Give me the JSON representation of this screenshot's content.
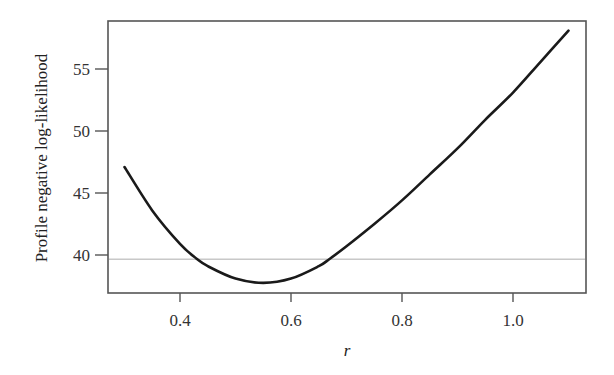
{
  "chart_data": {
    "type": "line",
    "title": "",
    "xlabel": "r",
    "ylabel": "Profile negative log-likelihood",
    "xlim": [
      0.28,
      1.13
    ],
    "ylim": [
      36.2,
      58.9
    ],
    "xticks": [
      0.4,
      0.6,
      0.8,
      1.0
    ],
    "xtick_labels": [
      "0.4",
      "0.6",
      "0.8",
      "1.0"
    ],
    "yticks": [
      40,
      45,
      50,
      55
    ],
    "ytick_labels": [
      "40",
      "45",
      "50",
      "55"
    ],
    "grid": false,
    "legend": null,
    "series": [
      {
        "name": "profile negative log-likelihood",
        "color": "#1a1a1a",
        "x": [
          0.3,
          0.35,
          0.4,
          0.43,
          0.45,
          0.5,
          0.55,
          0.6,
          0.65,
          0.67,
          0.7,
          0.75,
          0.8,
          0.85,
          0.9,
          0.95,
          1.0,
          1.05,
          1.1
        ],
        "y": [
          47.1,
          43.6,
          40.9,
          39.7,
          39.1,
          38.1,
          37.75,
          38.1,
          39.1,
          39.7,
          40.7,
          42.5,
          44.4,
          46.5,
          48.6,
          50.9,
          53.1,
          55.6,
          58.1
        ]
      }
    ],
    "reference_lines": [
      {
        "orientation": "horizontal",
        "y": 39.7,
        "color": "#c8c8c8",
        "label": ""
      }
    ],
    "annotations": []
  }
}
